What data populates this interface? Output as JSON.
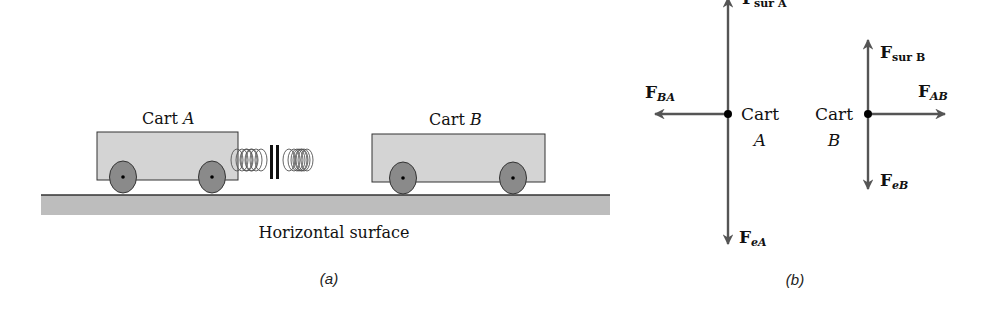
{
  "panel_a": {
    "caption": "(a)",
    "cart_a": {
      "label_prefix": "Cart ",
      "label_var": "A"
    },
    "cart_b": {
      "label_prefix": "Cart ",
      "label_var": "B"
    },
    "surface_label": "Horizontal surface",
    "colors": {
      "cart_fill": "#d4d4d4",
      "wheel_fill": "#8a8a8a",
      "surface_fill": "#bdbdbd",
      "outline": "#333333"
    }
  },
  "panel_b": {
    "caption": "(b)",
    "cart_a": {
      "label_line1": "Cart",
      "label_line2": "A",
      "forces": [
        {
          "main": "F",
          "sub": "sur A",
          "direction": "up"
        },
        {
          "main": "F",
          "sub": "BA",
          "direction": "left"
        },
        {
          "main": "F",
          "sub": "eA",
          "direction": "down"
        }
      ]
    },
    "cart_b": {
      "label_line1": "Cart",
      "label_line2": "B",
      "forces": [
        {
          "main": "F",
          "sub": "sur B",
          "direction": "up"
        },
        {
          "main": "F",
          "sub": "AB",
          "direction": "right"
        },
        {
          "main": "F",
          "sub": "eB",
          "direction": "down"
        }
      ]
    },
    "colors": {
      "arrow": "#555555",
      "dot": "#000000"
    }
  }
}
